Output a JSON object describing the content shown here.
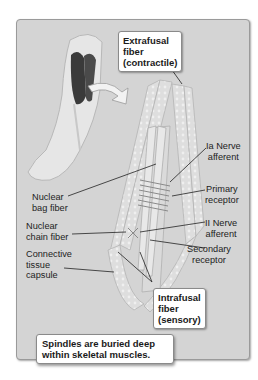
{
  "figure": {
    "callouts": {
      "extrafusal": "Extrafusal fiber (contractile)",
      "extrafusal_lines": [
        "Extrafusal",
        "fiber",
        "(contractile)"
      ],
      "intrafusal_lines": [
        "Intrafusal",
        "fiber",
        "(sensory)"
      ]
    },
    "labels": {
      "ia_nerve": [
        "Ia Nerve",
        "afferent"
      ],
      "primary_receptor": [
        "Primary",
        "receptor"
      ],
      "ii_nerve": [
        "II Nerve",
        "afferent"
      ],
      "secondary_receptor": [
        "Secondary",
        "receptor"
      ],
      "nuclear_bag": [
        "Nuclear",
        "bag fiber"
      ],
      "nuclear_chain": [
        "Nuclear",
        "chain fiber"
      ],
      "connective_tissue": [
        "Connective",
        "tissue",
        "capsule"
      ]
    },
    "caption_lines": [
      "Spindles are buried deep",
      "within skeletal muscles."
    ],
    "colors": {
      "panel_bg": "#d4d4d4",
      "fiber_fill": "#e4e4e4",
      "muscle_dark": "#3a3a3a",
      "callout_bg": "#ffffff"
    }
  }
}
